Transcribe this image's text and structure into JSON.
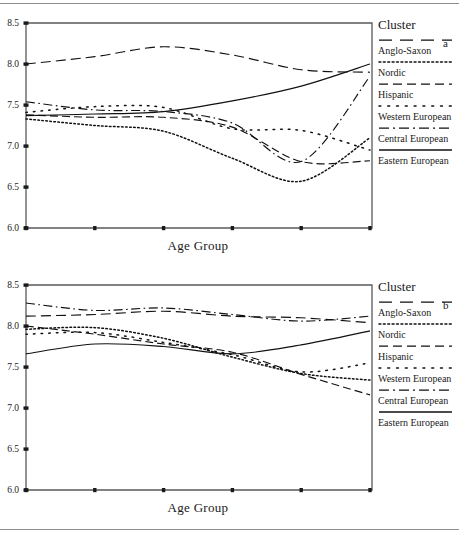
{
  "figure": {
    "panel_letters": [
      "a",
      "b"
    ],
    "axis_x_label": "Age Group",
    "legend_title": "Cluster"
  },
  "chart_data": [
    {
      "type": "line",
      "panel": "a",
      "title": "",
      "xlabel": "Age Group",
      "ylabel": "",
      "categories": [
        "18-24",
        "25-34",
        "35-44",
        "45-54",
        "55-64",
        "65+"
      ],
      "ylim": [
        6.0,
        8.5
      ],
      "yticks": [
        6.0,
        6.5,
        7.0,
        7.5,
        8.0,
        8.5
      ],
      "ytick_labels": [
        "6.0",
        "6.5",
        "7.0",
        "7.5",
        "8.0",
        "8.5"
      ],
      "grid": false,
      "legend_position": "right",
      "series": [
        {
          "name": "Anglo-Saxon",
          "style": "long-dash",
          "values": [
            8.0,
            8.09,
            8.21,
            8.11,
            7.93,
            7.9
          ]
        },
        {
          "name": "Nordic",
          "style": "fine-dot",
          "values": [
            7.33,
            7.25,
            7.18,
            6.85,
            6.57,
            7.1
          ]
        },
        {
          "name": "Hispanic",
          "style": "dash",
          "values": [
            7.38,
            7.35,
            7.35,
            7.23,
            6.81,
            6.82
          ]
        },
        {
          "name": "Western European",
          "style": "sparse-dot",
          "values": [
            7.41,
            7.48,
            7.47,
            7.21,
            7.19,
            6.95
          ]
        },
        {
          "name": "Central European",
          "style": "dash-dot",
          "values": [
            7.54,
            7.44,
            7.42,
            7.28,
            6.81,
            7.85
          ]
        },
        {
          "name": "Eastern European",
          "style": "solid",
          "values": [
            7.37,
            7.39,
            7.42,
            7.55,
            7.73,
            8.0
          ]
        }
      ]
    },
    {
      "type": "line",
      "panel": "b",
      "title": "",
      "xlabel": "Age Group",
      "ylabel": "",
      "categories": [
        "18-24",
        "25-34",
        "35-44",
        "45-54",
        "55-64",
        "65+"
      ],
      "ylim": [
        6.0,
        8.5
      ],
      "yticks": [
        6.0,
        6.5,
        7.0,
        7.5,
        8.0,
        8.5
      ],
      "ytick_labels": [
        "6.0",
        "6.5",
        "7.0",
        "7.5",
        "8.0",
        "8.5"
      ],
      "grid": false,
      "legend_position": "right",
      "series": [
        {
          "name": "Anglo-Saxon",
          "style": "long-dash",
          "values": [
            8.12,
            8.14,
            8.18,
            8.12,
            8.1,
            8.04
          ]
        },
        {
          "name": "Nordic",
          "style": "fine-dot",
          "values": [
            7.96,
            7.98,
            7.85,
            7.62,
            7.42,
            7.34
          ]
        },
        {
          "name": "Hispanic",
          "style": "dash",
          "values": [
            8.0,
            7.9,
            7.78,
            7.68,
            7.41,
            7.16
          ]
        },
        {
          "name": "Western European",
          "style": "sparse-dot",
          "values": [
            7.9,
            7.92,
            7.8,
            7.65,
            7.44,
            7.55
          ]
        },
        {
          "name": "Central European",
          "style": "dash-dot",
          "values": [
            8.28,
            8.19,
            8.22,
            8.14,
            8.06,
            8.12
          ]
        },
        {
          "name": "Eastern European",
          "style": "solid",
          "values": [
            7.66,
            7.78,
            7.75,
            7.66,
            7.77,
            7.94
          ]
        }
      ]
    }
  ],
  "legend": {
    "title": "Cluster",
    "entries": [
      {
        "label": "Anglo-Saxon",
        "style": "long-dash"
      },
      {
        "label": "Nordic",
        "style": "fine-dot"
      },
      {
        "label": "Hispanic",
        "style": "dash"
      },
      {
        "label": "Western European",
        "style": "sparse-dot"
      },
      {
        "label": "Central European",
        "style": "dash-dot"
      },
      {
        "label": "Eastern European",
        "style": "solid"
      }
    ]
  }
}
